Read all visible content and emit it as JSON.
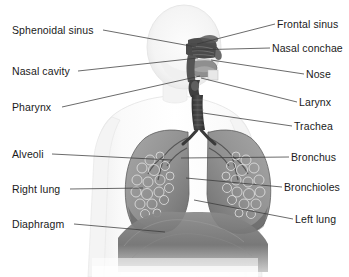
{
  "figure": {
    "background_color": "#ffffff",
    "text_color": "#1a1a1a",
    "leader_line_color": "#3a3a3a",
    "width": 349,
    "height": 277
  },
  "labels_left": [
    {
      "id": "sphenoidal-sinus",
      "text": "Sphenoidal sinus",
      "x": 12,
      "y": 24,
      "anchor_x": 103,
      "target_x": 196,
      "target_y": 47
    },
    {
      "id": "nasal-cavity",
      "text": "Nasal cavity",
      "x": 12,
      "y": 65,
      "anchor_x": 78,
      "target_x": 198,
      "target_y": 58
    },
    {
      "id": "pharynx",
      "text": "Pharynx",
      "x": 12,
      "y": 101,
      "anchor_x": 62,
      "target_x": 200,
      "target_y": 76
    },
    {
      "id": "alveoli",
      "text": "Alveoli",
      "x": 12,
      "y": 148,
      "anchor_x": 52,
      "target_x": 172,
      "target_y": 160
    },
    {
      "id": "right-lung",
      "text": "Right lung",
      "x": 12,
      "y": 183,
      "anchor_x": 70,
      "target_x": 143,
      "target_y": 188
    },
    {
      "id": "diaphragm",
      "text": "Diaphragm",
      "x": 12,
      "y": 218,
      "anchor_x": 74,
      "target_x": 165,
      "target_y": 232
    }
  ],
  "labels_right": [
    {
      "id": "frontal-sinus",
      "text": "Frontal sinus",
      "x": 277,
      "y": 18,
      "anchor_x": 275,
      "target_x": 197,
      "target_y": 44
    },
    {
      "id": "nasal-conchae",
      "text": "Nasal conchae",
      "x": 272,
      "y": 42,
      "anchor_x": 270,
      "target_x": 192,
      "target_y": 50
    },
    {
      "id": "nose",
      "text": "Nose",
      "x": 306,
      "y": 68,
      "anchor_x": 304,
      "target_x": 211,
      "target_y": 60
    },
    {
      "id": "larynx",
      "text": "Larynx",
      "x": 299,
      "y": 96,
      "anchor_x": 297,
      "target_x": 201,
      "target_y": 78
    },
    {
      "id": "trachea",
      "text": "Trachea",
      "x": 294,
      "y": 120,
      "anchor_x": 292,
      "target_x": 203,
      "target_y": 113
    },
    {
      "id": "bronchus",
      "text": "Bronchus",
      "x": 291,
      "y": 151,
      "anchor_x": 289,
      "target_x": 181,
      "target_y": 158
    },
    {
      "id": "bronchioles",
      "text": "Bronchioles",
      "x": 284,
      "y": 181,
      "anchor_x": 282,
      "target_x": 186,
      "target_y": 178
    },
    {
      "id": "left-lung",
      "text": "Left lung",
      "x": 295,
      "y": 213,
      "anchor_x": 293,
      "target_x": 194,
      "target_y": 200
    }
  ],
  "anatomy": {
    "body_silhouette_color": "#f2f2f2",
    "body_outline_color": "#dcdcdc",
    "head_color": "#f6f6f6",
    "nasal_structure_color": "#4a4a4a",
    "oral_cavity_color": "#8d8d8d",
    "trachea_color": "#3d3d3d",
    "lung_color": "#9a9a9a",
    "lung_dark_color": "#6e6e6e",
    "bronchial_tree_color": "#5a5a5a",
    "diaphragm_color": "#7a7a7a",
    "parts": [
      "head",
      "neck",
      "shoulders",
      "torso",
      "nasal cavity",
      "sphenoidal sinus",
      "frontal sinus",
      "nasal conchae",
      "nose",
      "oral cavity",
      "pharynx",
      "larynx",
      "trachea",
      "right lung",
      "left lung",
      "bronchus",
      "bronchioles",
      "alveoli",
      "diaphragm"
    ]
  }
}
